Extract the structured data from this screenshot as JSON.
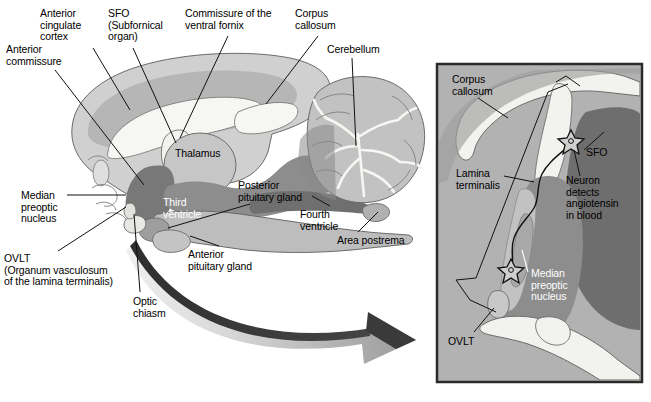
{
  "figure": {
    "colors": {
      "background": "#ffffff",
      "cortex_outer": "#d3d3d3",
      "cortex_inner": "#b8b8b8",
      "white_matter": "#f4f4f0",
      "thalamus": "#c9c9c9",
      "ventricle_dark": "#7c7c7c",
      "brainstem_mid": "#a8a8a8",
      "inset_background": "#b0b0b0",
      "inset_border": "#2a2a2a",
      "leader_line": "#111111",
      "arrow_dark": "#3a3a3a",
      "arrow_light": "#c8c8c8",
      "label_text": "#000000",
      "label_text_inverse": "#ffffff"
    }
  },
  "main_panel": {
    "name": "sagittal-brain-section",
    "labels": [
      {
        "id": "anterior-cingulate-cortex",
        "text": "Anterior\ncingulate\ncortex",
        "x": 40,
        "y": 8,
        "align": "left",
        "color": "black"
      },
      {
        "id": "sfo",
        "text": "SFO\n(Subfornical\norgan)",
        "x": 108,
        "y": 8,
        "align": "left",
        "color": "black"
      },
      {
        "id": "commissure-ventral-fornix",
        "text": "Commissure of the\nventral fornix",
        "x": 185,
        "y": 8,
        "align": "left",
        "color": "black"
      },
      {
        "id": "corpus-callosum-main",
        "text": "Corpus\ncallosum",
        "x": 295,
        "y": 8,
        "align": "left",
        "color": "black"
      },
      {
        "id": "cerebellum",
        "text": "Cerebellum",
        "x": 327,
        "y": 44,
        "align": "left",
        "color": "black"
      },
      {
        "id": "anterior-commissure",
        "text": "Anterior\ncommissure",
        "x": 6,
        "y": 44,
        "align": "left",
        "color": "black"
      },
      {
        "id": "thalamus",
        "text": "Thalamus",
        "x": 175,
        "y": 148,
        "align": "left",
        "color": "black"
      },
      {
        "id": "median-preoptic-nucleus",
        "text": "Median\npreoptic\nnucleus",
        "x": 21,
        "y": 190,
        "align": "left",
        "color": "black"
      },
      {
        "id": "posterior-pituitary-gland",
        "text": "Posterior\npituitary gland",
        "x": 238,
        "y": 180,
        "align": "left",
        "color": "black"
      },
      {
        "id": "third-ventricle",
        "text": "Third\nventricle",
        "x": 163,
        "y": 197,
        "align": "left",
        "color": "white"
      },
      {
        "id": "fourth-ventricle",
        "text": "Fourth\nventricle",
        "x": 300,
        "y": 209,
        "align": "left",
        "color": "black"
      },
      {
        "id": "area-postrema",
        "text": "Area postrema",
        "x": 337,
        "y": 235,
        "align": "left",
        "color": "black"
      },
      {
        "id": "ovlt-main",
        "text": "OVLT\n(Organum vasculosum\nof the lamina terminalis)",
        "x": 4,
        "y": 253,
        "align": "left",
        "color": "black"
      },
      {
        "id": "anterior-pituitary-gland",
        "text": "Anterior\npituitary gland",
        "x": 188,
        "y": 249,
        "align": "left",
        "color": "black"
      },
      {
        "id": "optic-chiasm",
        "text": "Optic\nchiasm",
        "x": 133,
        "y": 296,
        "align": "left",
        "color": "black"
      }
    ],
    "arrow": {
      "id": "transition-arrow",
      "description": "curved gradient arrow pointing from brain base toward inset panel"
    }
  },
  "inset_panel": {
    "name": "lamina-terminalis-detail",
    "bounds": {
      "x": 437,
      "y": 64,
      "width": 205,
      "height": 318
    },
    "labels": [
      {
        "id": "corpus-callosum-inset",
        "text": "Corpus\ncallosum",
        "x": 452,
        "y": 74,
        "align": "left",
        "color": "black"
      },
      {
        "id": "lamina-terminalis",
        "text": "Lamina\nterminalis",
        "x": 456,
        "y": 168,
        "align": "left",
        "color": "black"
      },
      {
        "id": "sfo-inset",
        "text": "SFO",
        "x": 586,
        "y": 147,
        "align": "left",
        "color": "black"
      },
      {
        "id": "neuron-detects-angiotensin",
        "text": "Neuron\ndetects\nangiotensin\nin blood",
        "x": 566,
        "y": 175,
        "align": "left",
        "color": "black"
      },
      {
        "id": "median-preoptic-nucleus-inset",
        "text": "Median\npreoptic\nnucleus",
        "x": 531,
        "y": 268,
        "align": "left",
        "color": "white"
      },
      {
        "id": "ovlt-inset",
        "text": "OVLT",
        "x": 448,
        "y": 336,
        "align": "left",
        "color": "black"
      }
    ],
    "neurons": [
      {
        "id": "neuron-sfo",
        "x": 571,
        "y": 139,
        "label": "star-shaped neuron at SFO"
      },
      {
        "id": "neuron-ovlt",
        "x": 511,
        "y": 270,
        "label": "star-shaped neuron at OVLT"
      }
    ]
  }
}
